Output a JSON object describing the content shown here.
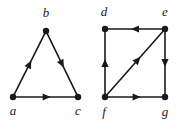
{
  "figure": {
    "background_color": "#ffffff",
    "ink_color": "#1a1a1a",
    "width": 177,
    "height": 124,
    "graphs": [
      {
        "id": "left-graph",
        "name": "triangle-digraph",
        "shape": "triangle",
        "nodes": [
          {
            "id": "a",
            "label": "a",
            "x": 13,
            "y": 97,
            "label_x": 13,
            "label_y": 115
          },
          {
            "id": "b",
            "label": "b",
            "x": 46,
            "y": 31,
            "label_x": 46,
            "label_y": 17
          },
          {
            "id": "c",
            "label": "c",
            "x": 78,
            "y": 97,
            "label_x": 78,
            "label_y": 115
          }
        ],
        "edges": [
          {
            "id": "a-b",
            "from": "a",
            "to": "b",
            "directed": true,
            "arrow_position": 0.5,
            "label": "a to b"
          },
          {
            "id": "b-c",
            "from": "b",
            "to": "c",
            "directed": true,
            "arrow_position": 0.5,
            "label": "b to c"
          },
          {
            "id": "a-c",
            "from": "a",
            "to": "c",
            "directed": true,
            "arrow_position": 0.52,
            "label": "a to c"
          }
        ]
      },
      {
        "id": "right-graph",
        "name": "square-diagonal-digraph",
        "shape": "square with diagonal",
        "nodes": [
          {
            "id": "d",
            "label": "d",
            "x": 105,
            "y": 29,
            "label_x": 104,
            "label_y": 16
          },
          {
            "id": "e",
            "label": "e",
            "x": 165,
            "y": 29,
            "label_x": 165,
            "label_y": 16
          },
          {
            "id": "f",
            "label": "f",
            "x": 105,
            "y": 97,
            "label_x": 104,
            "label_y": 116
          },
          {
            "id": "g",
            "label": "g",
            "x": 165,
            "y": 97,
            "label_x": 165,
            "label_y": 116
          }
        ],
        "edges": [
          {
            "id": "e-d",
            "from": "e",
            "to": "d",
            "directed": true,
            "arrow_position": 0.5,
            "label": "e to d"
          },
          {
            "id": "f-d",
            "from": "f",
            "to": "d",
            "directed": true,
            "arrow_position": 0.5,
            "label": "f to d"
          },
          {
            "id": "e-g",
            "from": "e",
            "to": "g",
            "directed": true,
            "arrow_position": 0.5,
            "label": "e to g"
          },
          {
            "id": "f-g",
            "from": "f",
            "to": "g",
            "directed": true,
            "arrow_position": 0.53,
            "label": "f to g"
          },
          {
            "id": "f-e",
            "from": "f",
            "to": "e",
            "directed": true,
            "arrow_position": 0.55,
            "label": "f to e"
          }
        ]
      }
    ],
    "node_radius": 3.2,
    "arrow_length": 8,
    "arrow_half_width": 3.6
  }
}
